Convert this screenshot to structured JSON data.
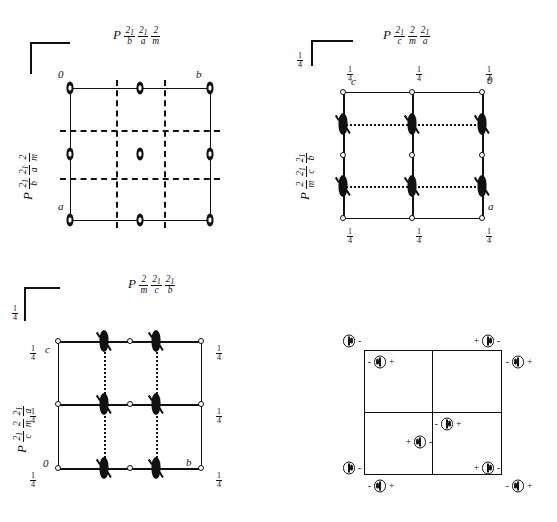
{
  "figure": {
    "kind": "space-group-symmetry-diagrams",
    "panels": [
      {
        "id": "panel-1",
        "title_parts": {
          "lattice": "P",
          "terms": [
            [
              "2₁",
              "b"
            ],
            [
              "2₁",
              "a"
            ],
            [
              "2",
              "m"
            ]
          ]
        },
        "title_plain": "P 2₁/b 2₁/a 2/m",
        "side_label_plain": "P 2₁/b 2₁/a 2/m",
        "side_label_parts": {
          "lattice": "P",
          "terms": [
            [
              "2₁",
              "b"
            ],
            [
              "2₁",
              "a"
            ],
            [
              "2",
              "m"
            ]
          ]
        },
        "cell_corner_labels": {
          "origin": "0",
          "right": "b",
          "bottom": "a"
        },
        "line_styles": {
          "cell_edges": "solid",
          "internal_mirrors": "dashed"
        }
      },
      {
        "id": "panel-2",
        "title_parts": {
          "lattice": "P",
          "terms": [
            [
              "2₁",
              "c"
            ],
            [
              "2",
              "m"
            ],
            [
              "2₁",
              "a"
            ]
          ]
        },
        "title_plain": "P 2₁/c 2/m 2₁/a",
        "side_label_plain": "P 2/m 2₁/c 2₁/b",
        "side_label_parts": {
          "lattice": "P",
          "terms": [
            [
              "2",
              "m"
            ],
            [
              "2₁",
              "c"
            ],
            [
              "2₁",
              "b"
            ]
          ]
        },
        "cell_corner_labels": {
          "origin": "0",
          "left": "c",
          "bottom_right": "a"
        },
        "fraction_tag": "1/4",
        "line_styles": {
          "cell_edges": "solid",
          "internal_glide": "dotted"
        }
      },
      {
        "id": "panel-3",
        "title_parts": {
          "lattice": "P",
          "terms": [
            [
              "2",
              "m"
            ],
            [
              "2₁",
              "c"
            ],
            [
              "2₁",
              "b"
            ]
          ]
        },
        "title_plain": "P 2/m 2₁/c 2₁/b",
        "side_label_plain": "P 2₁/c 2/m 2₁/a",
        "side_label_parts": {
          "lattice": "P",
          "terms": [
            [
              "2₁",
              "c"
            ],
            [
              "2",
              "m"
            ],
            [
              "2₁",
              "a"
            ]
          ]
        },
        "cell_corner_labels": {
          "origin": "0",
          "top_left": "c",
          "bottom_right": "b"
        },
        "fraction_tag": "1/4",
        "line_styles": {
          "cell_edges": "solid",
          "internal_glide": "dotted"
        }
      },
      {
        "id": "panel-4",
        "title_plain": "",
        "kind": "general-position-diagram",
        "quadrants": 4,
        "site_symbol": "circle-with-comma",
        "signs": [
          "+",
          "-"
        ]
      }
    ],
    "fraction_labels": {
      "quarter_num": "1",
      "quarter_den": "4"
    },
    "general_positions": [
      {
        "id": "gp-1",
        "x": 4,
        "y": 11,
        "pre": "",
        "post": "-",
        "comma": "right"
      },
      {
        "id": "gp-2",
        "x": 32,
        "y": 32,
        "pre": "-",
        "post": "+",
        "comma": "left"
      },
      {
        "id": "gp-3",
        "x": 123,
        "y": 11,
        "pre": "+",
        "post": "-",
        "comma": "right"
      },
      {
        "id": "gp-4",
        "x": 152,
        "y": 32,
        "pre": "-",
        "post": "+",
        "comma": "left"
      },
      {
        "id": "gp-5",
        "x": 90,
        "y": 83,
        "pre": "-",
        "post": "+",
        "comma": "right"
      },
      {
        "id": "gp-6",
        "x": 68,
        "y": 102,
        "pre": "+",
        "post": "-",
        "comma": "left"
      },
      {
        "id": "gp-7",
        "x": 4,
        "y": 143,
        "pre": "",
        "post": "-",
        "comma": "right"
      },
      {
        "id": "gp-8",
        "x": 32,
        "y": 163,
        "pre": "-",
        "post": "+",
        "comma": "left"
      },
      {
        "id": "gp-9",
        "x": 123,
        "y": 143,
        "pre": "+",
        "post": "-",
        "comma": "right"
      },
      {
        "id": "gp-10",
        "x": 152,
        "y": 163,
        "pre": "-",
        "post": "+",
        "comma": "left"
      }
    ],
    "colors": {
      "ink": "#111111",
      "paper": "#ffffff"
    }
  }
}
